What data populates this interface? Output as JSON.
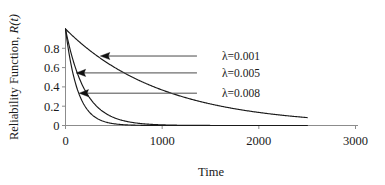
{
  "chart_data": {
    "type": "line",
    "title": "",
    "xlabel": "Time",
    "ylabel_parts": {
      "main": "Reliability Function, ",
      "italic": "R(t)"
    },
    "ylabel": "Reliability Function, R(t)",
    "xlim": [
      0,
      3000
    ],
    "ylim": [
      0,
      1.0
    ],
    "xticks": [
      0,
      1000,
      2000,
      3000
    ],
    "xtick_labels": [
      "0",
      "1000",
      "2000",
      "3000"
    ],
    "yticks": [
      0,
      0.2,
      0.4,
      0.6,
      0.8
    ],
    "ytick_labels": [
      "0",
      "0.2",
      "0.4",
      "0.6",
      "0.8"
    ],
    "grid": false,
    "legend_position": "inline-annotations",
    "function": "R(t) = exp(-lambda * t)",
    "series": [
      {
        "name": "λ=0.001",
        "lambda": 0.001,
        "t_max": 2500,
        "x": [
          0,
          100,
          200,
          300,
          400,
          500,
          600,
          700,
          800,
          900,
          1000,
          1200,
          1400,
          1600,
          1800,
          2000,
          2200,
          2500
        ],
        "values": [
          1.0,
          0.905,
          0.819,
          0.741,
          0.67,
          0.607,
          0.549,
          0.497,
          0.449,
          0.407,
          0.368,
          0.301,
          0.247,
          0.202,
          0.165,
          0.135,
          0.111,
          0.082
        ]
      },
      {
        "name": "λ=0.005",
        "lambda": 0.005,
        "t_max": 2500,
        "x": [
          0,
          50,
          100,
          150,
          200,
          250,
          300,
          400,
          500,
          600,
          700,
          800,
          900,
          1000,
          1250,
          1500,
          2000,
          2500
        ],
        "values": [
          1.0,
          0.779,
          0.607,
          0.472,
          0.368,
          0.287,
          0.223,
          0.135,
          0.082,
          0.05,
          0.03,
          0.018,
          0.011,
          0.007,
          0.002,
          0.001,
          0.0,
          0.0
        ]
      },
      {
        "name": "λ=0.008",
        "lambda": 0.008,
        "t_max": 2500,
        "x": [
          0,
          50,
          100,
          150,
          200,
          250,
          300,
          400,
          500,
          600,
          700,
          800,
          900,
          1000,
          1250,
          1500,
          2000,
          2500
        ],
        "values": [
          1.0,
          0.67,
          0.449,
          0.301,
          0.202,
          0.135,
          0.091,
          0.041,
          0.018,
          0.008,
          0.004,
          0.002,
          0.001,
          0.0,
          0.0,
          0.0,
          0.0,
          0.0
        ]
      }
    ],
    "annotations": [
      {
        "label": "λ=0.001",
        "points_to_series": "λ=0.001",
        "arrow_y_value": 0.72,
        "arrow_tip_x": 360,
        "arrow_tail_x": 1360
      },
      {
        "label": "λ=0.005",
        "points_to_series": "λ=0.005",
        "arrow_y_value": 0.545,
        "arrow_tip_x": 110,
        "arrow_tail_x": 1360
      },
      {
        "label": "λ=0.008",
        "points_to_series": "λ=0.008",
        "arrow_y_value": 0.335,
        "arrow_tip_x": 140,
        "arrow_tail_x": 1360
      }
    ]
  }
}
